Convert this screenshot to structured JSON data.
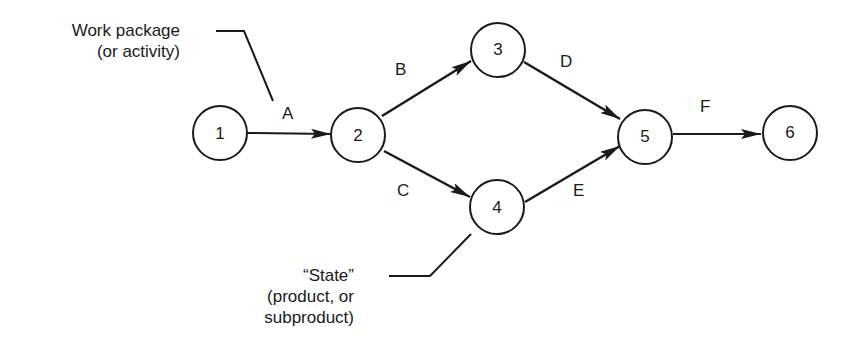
{
  "nodes": [
    {
      "id": "1",
      "label": "1",
      "cx": 220,
      "cy": 133
    },
    {
      "id": "2",
      "label": "2",
      "cx": 358,
      "cy": 135
    },
    {
      "id": "3",
      "label": "3",
      "cx": 498,
      "cy": 50
    },
    {
      "id": "4",
      "label": "4",
      "cx": 497,
      "cy": 207
    },
    {
      "id": "5",
      "label": "5",
      "cx": 645,
      "cy": 137
    },
    {
      "id": "6",
      "label": "6",
      "cx": 790,
      "cy": 133
    }
  ],
  "edges": [
    {
      "label": "A",
      "from": "1",
      "to": "2"
    },
    {
      "label": "B",
      "from": "2",
      "to": "3"
    },
    {
      "label": "C",
      "from": "2",
      "to": "4"
    },
    {
      "label": "D",
      "from": "3",
      "to": "5"
    },
    {
      "label": "E",
      "from": "4",
      "to": "5"
    },
    {
      "label": "F",
      "from": "5",
      "to": "6"
    }
  ],
  "annotations": {
    "work_package": {
      "line1": "Work package",
      "line2": "(or activity)"
    },
    "state": {
      "line1": "“State”",
      "line2": "(product, or",
      "line3": "subproduct)"
    }
  },
  "colors": {
    "stroke": "#1a1a1a",
    "background": "#ffffff"
  }
}
